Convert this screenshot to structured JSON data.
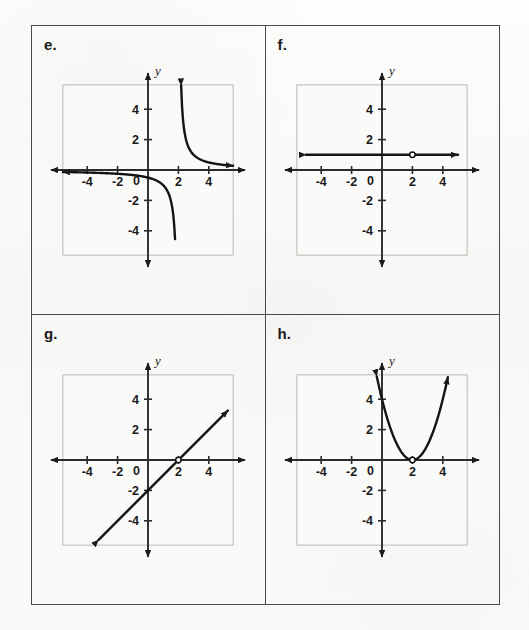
{
  "page": {
    "background_color": "#fbfbfa",
    "border_color": "#4a4a4a"
  },
  "panels": [
    {
      "id": "e",
      "label": "e.",
      "position": "top-left",
      "graph": {
        "x_axis_label": "x",
        "y_axis_label": "y",
        "origin_label": "0",
        "x_ticks": [
          "-4",
          "-2",
          "2",
          "4"
        ],
        "y_ticks": [
          "4",
          "2",
          "-2",
          "-4"
        ],
        "xlim": [
          -5.5,
          5.5
        ],
        "ylim": [
          -5.5,
          5.5
        ],
        "grid": true,
        "curve_type": "hyperbola",
        "description": "rational function with vertical asymptote x = 2 and horizontal asymptote y = 0",
        "asymptote_x": 2,
        "asymptote_y": 0
      }
    },
    {
      "id": "f",
      "label": "f.",
      "position": "top-right",
      "graph": {
        "x_axis_label": "x",
        "y_axis_label": "y",
        "origin_label": "0",
        "x_ticks": [
          "-4",
          "-2",
          "2",
          "4"
        ],
        "y_ticks": [
          "4",
          "2",
          "-2",
          "-4"
        ],
        "xlim": [
          -5.5,
          5.5
        ],
        "ylim": [
          -5.5,
          5.5
        ],
        "grid": true,
        "curve_type": "horizontal-line",
        "description": "horizontal line y = 1 with a hole at (2, 1)",
        "line_y": 1,
        "open_point": [
          2,
          1
        ]
      }
    },
    {
      "id": "g",
      "label": "g.",
      "position": "bottom-left",
      "graph": {
        "x_axis_label": "x",
        "y_axis_label": "y",
        "origin_label": "0",
        "x_ticks": [
          "-4",
          "-2",
          "2",
          "4"
        ],
        "y_ticks": [
          "4",
          "2",
          "-2",
          "-4"
        ],
        "xlim": [
          -5.5,
          5.5
        ],
        "ylim": [
          -5.5,
          5.5
        ],
        "grid": true,
        "curve_type": "line",
        "description": "line y = x - 2 with a hole at (2, 0)",
        "slope": 1,
        "y_intercept": -2,
        "open_point": [
          2,
          0
        ]
      }
    },
    {
      "id": "h",
      "label": "h.",
      "position": "bottom-right",
      "graph": {
        "x_axis_label": "x",
        "y_axis_label": "y",
        "origin_label": "0",
        "x_ticks": [
          "-4",
          "-2",
          "2",
          "4"
        ],
        "y_ticks": [
          "4",
          "2",
          "-2",
          "-4"
        ],
        "xlim": [
          -5.5,
          5.5
        ],
        "ylim": [
          -5.5,
          5.5
        ],
        "grid": true,
        "curve_type": "parabola",
        "description": "parabola y = (x - 2)^2 with a hole at the vertex (2, 0)",
        "vertex": [
          2,
          0
        ],
        "open_point": [
          2,
          0
        ]
      }
    }
  ],
  "chart_data": [
    {
      "type": "line",
      "panel": "e",
      "title": "",
      "xlabel": "x",
      "ylabel": "y",
      "xlim": [
        -5.5,
        5.5
      ],
      "ylim": [
        -5.5,
        5.5
      ],
      "grid": true,
      "equation": "y = 1/(x-2)",
      "series": [
        {
          "name": "left branch",
          "x": [
            -5.5,
            -5,
            -4,
            -3,
            -2,
            -1,
            0,
            0.5,
            1,
            1.4,
            1.7,
            1.82
          ],
          "y": [
            -0.133,
            -0.143,
            -0.167,
            -0.2,
            -0.25,
            -0.333,
            -0.5,
            -0.667,
            -1,
            -1.667,
            -3.333,
            -5.5
          ]
        },
        {
          "name": "right branch",
          "x": [
            2.18,
            2.3,
            2.5,
            3,
            3.5,
            4,
            4.5,
            5,
            5.5
          ],
          "y": [
            5.5,
            3.333,
            2,
            1,
            0.667,
            0.5,
            0.4,
            0.333,
            0.286
          ]
        }
      ]
    },
    {
      "type": "line",
      "panel": "f",
      "title": "",
      "xlabel": "x",
      "ylabel": "y",
      "xlim": [
        -5.5,
        5.5
      ],
      "ylim": [
        -5.5,
        5.5
      ],
      "grid": true,
      "equation": "y = 1, x != 2",
      "series": [
        {
          "name": "y = 1",
          "x": [
            -5,
            5
          ],
          "y": [
            1,
            1
          ]
        }
      ],
      "open_points": [
        [
          2,
          1
        ]
      ]
    },
    {
      "type": "line",
      "panel": "g",
      "title": "",
      "xlabel": "x",
      "ylabel": "y",
      "xlim": [
        -5.5,
        5.5
      ],
      "ylim": [
        -5.5,
        5.5
      ],
      "grid": true,
      "equation": "y = x - 2, x != 2",
      "series": [
        {
          "name": "y = x - 2",
          "x": [
            -3.2,
            5.2
          ],
          "y": [
            -5.2,
            3.2
          ]
        }
      ],
      "open_points": [
        [
          2,
          0
        ]
      ]
    },
    {
      "type": "line",
      "panel": "h",
      "title": "",
      "xlabel": "x",
      "ylabel": "y",
      "xlim": [
        -5.5,
        5.5
      ],
      "ylim": [
        -5.5,
        5.5
      ],
      "grid": true,
      "equation": "y = (x - 2)^2, x != 2",
      "series": [
        {
          "name": "parabola",
          "x": [
            -0.35,
            0,
            0.5,
            1,
            1.5,
            2,
            2.5,
            3,
            3.5,
            4,
            4.35
          ],
          "y": [
            5.5,
            4,
            2.25,
            1,
            0.25,
            0,
            0.25,
            1,
            2.25,
            4,
            5.5
          ]
        }
      ],
      "open_points": [
        [
          2,
          0
        ]
      ]
    }
  ]
}
